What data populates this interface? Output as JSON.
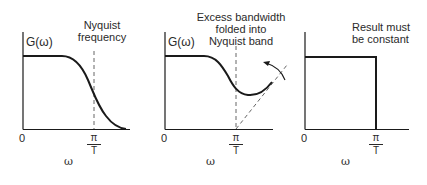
{
  "figure": {
    "panels": [
      {
        "id": "original-spectrum",
        "ylabel": "G(ω)",
        "annotation": [
          "Nyquist",
          "frequency"
        ],
        "origin_label": "0",
        "cutoff_label_num": "π",
        "cutoff_label_den": "T",
        "xlabel": "ω"
      },
      {
        "id": "folded-spectrum",
        "ylabel": "G(ω)",
        "annotation": [
          "Excess bandwidth",
          "folded into",
          "Nyquist band"
        ],
        "origin_label": "0",
        "cutoff_label_num": "π",
        "cutoff_label_den": "T",
        "xlabel": "ω"
      },
      {
        "id": "result-spectrum",
        "annotation": [
          "Result must",
          "be constant"
        ],
        "origin_label": "0",
        "cutoff_label_num": "π",
        "cutoff_label_den": "T",
        "xlabel": "ω"
      }
    ],
    "colors": {
      "stroke": "#1a1a1a",
      "dashed": "#555555",
      "background": "#ffffff"
    }
  }
}
